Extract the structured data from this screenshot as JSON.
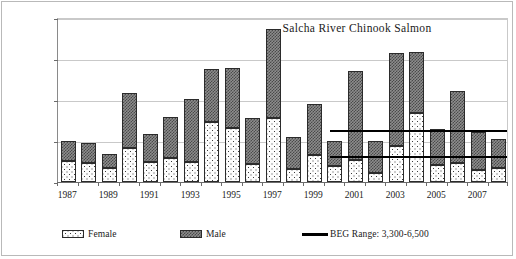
{
  "chart_data": {
    "type": "bar",
    "title": "Salcha River Chinook Salmon",
    "xlabel": "",
    "ylabel": "Escapement (number of fish)",
    "ylim": [
      0,
      20000
    ],
    "ytick_labels": [
      "20,000",
      "15,000",
      "10,000",
      "5,000",
      "0"
    ],
    "ytick_values": [
      20000,
      15000,
      10000,
      5000,
      0
    ],
    "grid": true,
    "legend_position": "bottom",
    "stacked": true,
    "categories": [
      "1987",
      "1988",
      "1989",
      "1990",
      "1991",
      "1992",
      "1993",
      "1994",
      "1995",
      "1996",
      "1997",
      "1998",
      "1999",
      "2000",
      "2001",
      "2002",
      "2003",
      "2004",
      "2005",
      "2006",
      "2007",
      "2008"
    ],
    "xtick_labels_shown": [
      "1987",
      "1989",
      "1991",
      "1993",
      "1995",
      "1997",
      "1999",
      "2001",
      "2003",
      "2005",
      "2007"
    ],
    "series": [
      {
        "name": "Female",
        "values": [
          2600,
          2300,
          1650,
          4150,
          2500,
          2950,
          2500,
          7350,
          6550,
          2200,
          7750,
          1550,
          3350,
          1950,
          2650,
          1150,
          4450,
          8400,
          2050,
          2300,
          1450,
          1700
        ]
      },
      {
        "name": "Male",
        "values": [
          2350,
          2400,
          1800,
          6650,
          3300,
          5000,
          7600,
          6450,
          7300,
          5550,
          10900,
          3950,
          6150,
          3000,
          10900,
          3800,
          11300,
          7500,
          4450,
          8750,
          4650,
          3550
        ]
      }
    ],
    "totals": [
      4950,
      4700,
      3450,
      10800,
      5800,
      7950,
      10100,
      13800,
      13850,
      7750,
      18650,
      5500,
      9500,
      4950,
      13550,
      4950,
      15750,
      15900,
      6500,
      11050,
      6100,
      5250
    ],
    "reference_lines": [
      {
        "label": "BEG upper",
        "value": 6500,
        "start_category": "2000",
        "end_category": "2008"
      },
      {
        "label": "BEG lower",
        "value": 3300,
        "start_category": "2000",
        "end_category": "2008"
      }
    ],
    "legend_entries": [
      {
        "label": "Female",
        "swatch": "dotted-white-fill"
      },
      {
        "label": "Male",
        "swatch": "checkered-gray-fill"
      },
      {
        "label": "BEG Range:  3,300-6,500",
        "swatch": "solid-black-line"
      }
    ]
  }
}
